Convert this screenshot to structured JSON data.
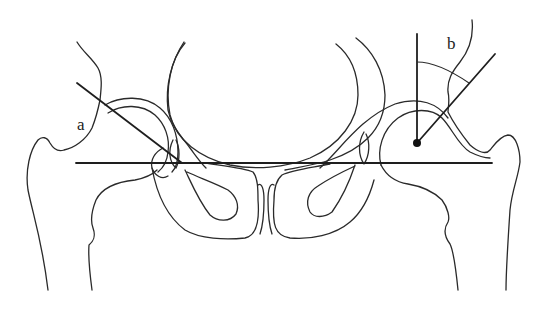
{
  "figure": {
    "type": "anatomical line drawing",
    "labels": {
      "a": "a",
      "b": "b"
    },
    "annotations": [
      {
        "id": "a",
        "description": "line tangent to left acetabular roof crossing the horizontal reference line"
      },
      {
        "id": "b",
        "description": "angle between vertical line through right femoral head center and line to acetabular edge"
      }
    ],
    "reference_line": "horizontal line through both triradiate cartilages",
    "colors": {
      "line": "#2a2a2a",
      "background": "#ffffff"
    }
  }
}
